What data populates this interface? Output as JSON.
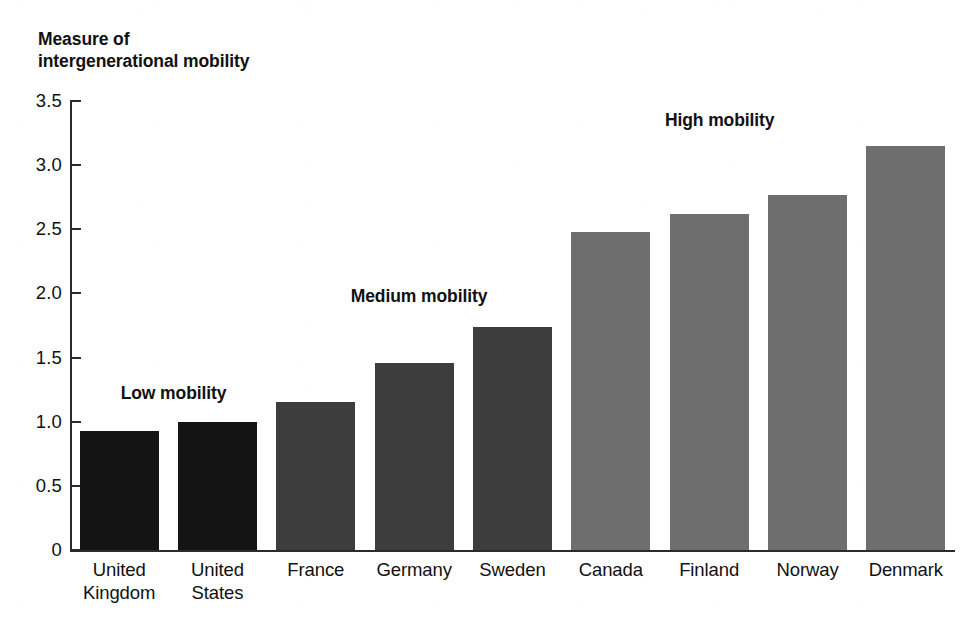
{
  "chart_data": {
    "type": "bar",
    "title": "",
    "subtitle": "",
    "xlabel": "",
    "ylabel": "Measure of\nintergenerational mobility",
    "categories": [
      "United\nKingdom",
      "United\nStates",
      "France",
      "Germany",
      "Sweden",
      "Canada",
      "Finland",
      "Norway",
      "Denmark"
    ],
    "values": [
      0.93,
      1.0,
      1.15,
      1.46,
      1.74,
      2.48,
      2.62,
      2.77,
      3.15
    ],
    "groups": [
      "low",
      "low",
      "medium",
      "medium",
      "medium",
      "high",
      "high",
      "high",
      "high"
    ],
    "ylim": [
      0,
      3.5
    ],
    "yticks": [
      0,
      0.5,
      1.0,
      1.5,
      2.0,
      2.5,
      3.0,
      3.5
    ],
    "ytick_labels": [
      "0",
      "0.5",
      "1.0",
      "1.5",
      "2.0",
      "2.5",
      "3.0",
      "3.5"
    ],
    "grid": false,
    "legend": "none",
    "annotations": [
      {
        "text": "Low mobility",
        "x_pct": 12.5,
        "y_value": 1.22
      },
      {
        "text": "Medium mobility",
        "x_pct": 38.5,
        "y_value": 1.98
      },
      {
        "text": "High mobility",
        "x_pct": 74.0,
        "y_value": 3.35
      }
    ],
    "colors": {
      "low": "#141414",
      "medium": "#3d3d3d",
      "high": "#6e6e6e",
      "axis": "#2b2b2b",
      "text": "#111111",
      "background": "#ffffff"
    }
  }
}
